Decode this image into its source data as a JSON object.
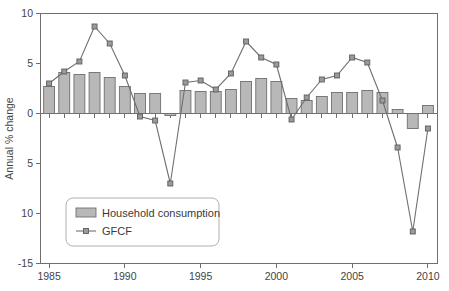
{
  "chart_data": {
    "type": "bar",
    "title": "",
    "subtitle": "",
    "xlabel": "",
    "ylabel": "Annual % change",
    "ylim": [
      -15,
      10
    ],
    "xlim": [
      1984.4,
      2010.6
    ],
    "ytick_labels": [
      "10",
      "5",
      "0",
      "5",
      "10",
      "-15"
    ],
    "ytick_values": [
      10,
      5,
      0,
      -5,
      -10,
      -15
    ],
    "xtick_labels": [
      "1985",
      "1990",
      "1995",
      "2000",
      "2005",
      "2010"
    ],
    "xtick_values": [
      1985,
      1990,
      1995,
      2000,
      2005,
      2010
    ],
    "grid": false,
    "legend_position": "bottom-left",
    "categories": [
      1985,
      1986,
      1987,
      1988,
      1989,
      1990,
      1991,
      1992,
      1993,
      1994,
      1995,
      1996,
      1997,
      1998,
      1999,
      2000,
      2001,
      2002,
      2003,
      2004,
      2005,
      2006,
      2007,
      2008,
      2009,
      2010
    ],
    "series": [
      {
        "name": "Household consumption",
        "type": "bar",
        "values": [
          2.7,
          4.1,
          3.9,
          4.1,
          3.6,
          2.7,
          2.0,
          2.0,
          -0.2,
          2.3,
          2.2,
          2.2,
          2.4,
          3.2,
          3.5,
          3.2,
          1.5,
          1.3,
          1.7,
          2.1,
          2.1,
          2.3,
          2.1,
          0.4,
          -1.5,
          0.8
        ]
      },
      {
        "name": "GFCF",
        "type": "line",
        "values": [
          3.0,
          4.2,
          5.2,
          8.7,
          7.0,
          3.8,
          -0.3,
          -0.7,
          -7.0,
          3.1,
          3.3,
          2.4,
          4.0,
          7.2,
          5.6,
          4.9,
          -0.6,
          1.6,
          3.4,
          3.8,
          5.6,
          5.1,
          1.3,
          -3.4,
          -11.8,
          -1.5
        ]
      }
    ]
  },
  "legend": {
    "items": [
      {
        "label": "Household consumption",
        "marker": "bar-swatch",
        "color": "#b8b8b8"
      },
      {
        "label": "GFCF",
        "marker": "line-marker",
        "color": "#6f6f6f"
      }
    ]
  },
  "colors": {
    "bar_fill": "#b8b8b8",
    "bar_stroke": "#6f6f6f",
    "line": "#6f6f6f",
    "marker_fill": "#9a9a9a",
    "axis": "#6f6f6f",
    "text": "#444444",
    "background": "#ffffff"
  }
}
